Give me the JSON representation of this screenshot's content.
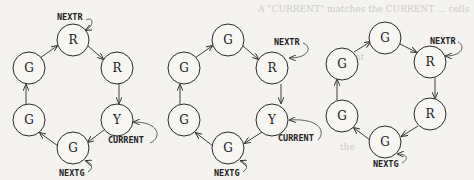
{
  "figure": {
    "diagrams": [
      {
        "id": "diagram-1",
        "offset_x": 0,
        "nodes": [
          {
            "label": "R",
            "x": 73,
            "y": 40
          },
          {
            "label": "R",
            "x": 117,
            "y": 68
          },
          {
            "label": "Y",
            "x": 117,
            "y": 120
          },
          {
            "label": "G",
            "x": 73,
            "y": 148
          },
          {
            "label": "G",
            "x": 29,
            "y": 120
          },
          {
            "label": "G",
            "x": 29,
            "y": 68
          }
        ],
        "pointers": [
          {
            "label": "NEXTR",
            "target_index": 0
          },
          {
            "label": "CURRENT",
            "target_index": 2
          },
          {
            "label": "NEXTG",
            "target_index": 3
          }
        ]
      },
      {
        "id": "diagram-2",
        "offset_x": 150,
        "nodes": [
          {
            "label": "G",
            "x": 228,
            "y": 40
          },
          {
            "label": "R",
            "x": 272,
            "y": 68
          },
          {
            "label": "Y",
            "x": 272,
            "y": 120
          },
          {
            "label": "G",
            "x": 228,
            "y": 148
          },
          {
            "label": "G",
            "x": 184,
            "y": 120
          },
          {
            "label": "G",
            "x": 184,
            "y": 68
          }
        ],
        "pointers": [
          {
            "label": "NEXTR",
            "target_index": 1
          },
          {
            "label": "CURRENT",
            "target_index": 2
          },
          {
            "label": "NEXTG",
            "target_index": 3
          }
        ]
      },
      {
        "id": "diagram-3",
        "offset_x": 300,
        "nodes": [
          {
            "label": "G",
            "x": 385,
            "y": 38
          },
          {
            "label": "R",
            "x": 430,
            "y": 62
          },
          {
            "label": "R",
            "x": 430,
            "y": 114
          },
          {
            "label": "G",
            "x": 385,
            "y": 142
          },
          {
            "label": "G",
            "x": 342,
            "y": 116
          },
          {
            "label": "G",
            "x": 342,
            "y": 64
          }
        ],
        "pointers": [
          {
            "label": "NEXTR",
            "target_index": 1
          },
          {
            "label": "NEXTG",
            "target_index": 3
          }
        ]
      }
    ],
    "labels": {
      "d1_nextr": "NEXTR",
      "d1_current": "CURRENT",
      "d1_nextg": "NEXTG",
      "d2_nextr": "NEXTR",
      "d2_current": "CURRENT",
      "d2_nextg": "NEXTG",
      "d3_nextr": "NEXTR",
      "d3_nextg": "NEXTG"
    },
    "node_labels": {
      "d1": [
        "R",
        "R",
        "Y",
        "G",
        "G",
        "G"
      ],
      "d2": [
        "G",
        "R",
        "Y",
        "G",
        "G",
        "G"
      ],
      "d3": [
        "G",
        "R",
        "R",
        "G",
        "G",
        "G"
      ]
    }
  }
}
